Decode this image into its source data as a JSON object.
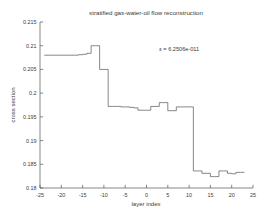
{
  "chart_data": {
    "type": "line",
    "title": "stratified gas-water-oil flow reconstruction",
    "xlabel": "layer index",
    "ylabel": "cross section",
    "xlim": [
      -25,
      25
    ],
    "ylim": [
      0.18,
      0.215
    ],
    "xticks": [
      -25,
      -20,
      -15,
      -10,
      -5,
      0,
      5,
      10,
      15,
      20,
      25
    ],
    "xticklabels": [
      "-25",
      "-20",
      "-15",
      "-10",
      "-5",
      "0",
      "5",
      "10",
      "15",
      "20",
      "25"
    ],
    "yticks": [
      0.18,
      0.185,
      0.19,
      0.195,
      0.2,
      0.205,
      0.21,
      0.215
    ],
    "yticklabels": [
      "0.18",
      "0.185",
      "0.19",
      "0.195",
      "0.2",
      "0.205",
      "0.21",
      "0.215"
    ],
    "grid": false,
    "legend": null,
    "drawstyle": "steps-post",
    "annotations": [
      {
        "text": "ε =  6.2506e-011",
        "x": 3.0,
        "y": 0.2088
      }
    ],
    "series": [
      {
        "name": "reconstructed cross section",
        "color": "#555555",
        "x": [
          -24,
          -23,
          -22,
          -21,
          -20,
          -19,
          -18,
          -17,
          -16,
          -15,
          -14,
          -13,
          -12,
          -11,
          -10,
          -9,
          -8,
          -7,
          -6,
          -5,
          -4,
          -3,
          -2,
          -1,
          0,
          1,
          2,
          3,
          4,
          5,
          6,
          7,
          8,
          9,
          10,
          11,
          12,
          13,
          14,
          15,
          16,
          17,
          18,
          19,
          20,
          21,
          22
        ],
        "values": [
          0.208,
          0.208,
          0.208,
          0.208,
          0.208,
          0.208,
          0.208,
          0.208,
          0.2081,
          0.2082,
          0.2084,
          0.21,
          0.21,
          0.205,
          0.205,
          0.1972,
          0.1972,
          0.1972,
          0.1971,
          0.1971,
          0.197,
          0.1969,
          0.1964,
          0.1964,
          0.1964,
          0.1972,
          0.1972,
          0.198,
          0.198,
          0.1963,
          0.1963,
          0.1971,
          0.1971,
          0.1971,
          0.1971,
          0.1836,
          0.1836,
          0.1831,
          0.1831,
          0.1824,
          0.1824,
          0.1836,
          0.1836,
          0.1831,
          0.183,
          0.1833,
          0.1833
        ]
      }
    ]
  }
}
